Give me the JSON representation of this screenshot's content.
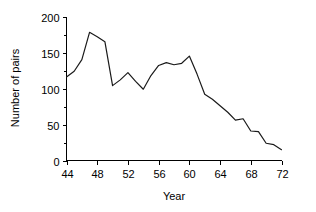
{
  "chart_data": {
    "type": "line",
    "title": "",
    "xlabel": "Year",
    "ylabel": "Number of pairs",
    "xlim": [
      44,
      72
    ],
    "ylim": [
      0,
      200
    ],
    "grid": false,
    "legend": null,
    "x_ticks": [
      44,
      48,
      52,
      56,
      60,
      64,
      68,
      72
    ],
    "x_tick_labels": [
      "44",
      "48",
      "52",
      "56",
      "60",
      "64",
      "68",
      "72"
    ],
    "y_ticks": [
      0,
      50,
      100,
      150,
      200
    ],
    "y_tick_labels": [
      "0",
      "50",
      "100",
      "150",
      "200"
    ],
    "y_minor_ticks": [
      25,
      75,
      125,
      175
    ],
    "series": [
      {
        "name": "Number of pairs",
        "color": "#1a1a1a",
        "x": [
          44,
          45,
          46,
          47,
          48,
          49,
          50,
          51,
          52,
          53,
          54,
          55,
          56,
          57,
          58,
          59,
          60,
          61,
          62,
          63,
          64,
          65,
          66,
          67,
          68,
          69,
          70,
          71,
          72
        ],
        "values": [
          116,
          124,
          140,
          178,
          172,
          165,
          104,
          112,
          122,
          110,
          99,
          118,
          132,
          136,
          133,
          135,
          145,
          120,
          92,
          85,
          76,
          67,
          56,
          58,
          41,
          40,
          24,
          22,
          15
        ]
      }
    ]
  },
  "axes": {
    "y_axis_title": "Number of pairs",
    "x_axis_title": "Year"
  }
}
